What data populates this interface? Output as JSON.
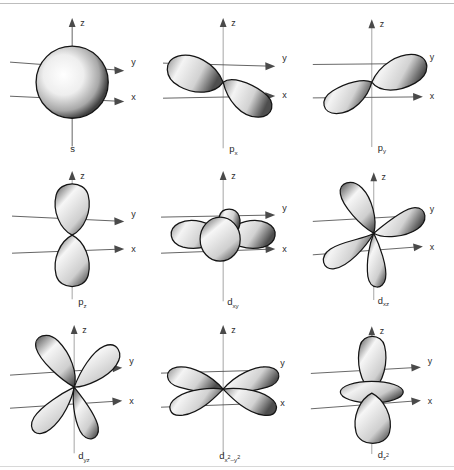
{
  "figure": {
    "type": "diagram-grid",
    "rows": 3,
    "columns": 3,
    "background_color": "#ffffff",
    "line_color": "#4a4a4a",
    "outline_color": "#141414",
    "fill_light": "#ffffff",
    "fill_dark": "#4a4a4a"
  },
  "axes": {
    "z_label": "z",
    "y_label": "y",
    "x_label": "x",
    "description": "Right-handed 3D axes drawn in each panel: z vertical with arrowhead up, y to upper-right with arrowhead, x to lower-right with arrowhead"
  },
  "panels": [
    {
      "id": "s",
      "label_base": "s",
      "label_sub": "",
      "label_sup": "",
      "full_label": "s",
      "shape": "sphere",
      "lobe_count": 1,
      "description": "Single shaded sphere centred on origin"
    },
    {
      "id": "px",
      "label_base": "p",
      "label_sub": "x",
      "label_sup": "",
      "full_label": "px",
      "shape": "two-lobe",
      "lobe_count": 2,
      "description": "Two teardrop lobes along the x axis"
    },
    {
      "id": "py",
      "label_base": "p",
      "label_sub": "y",
      "label_sup": "",
      "full_label": "py",
      "shape": "two-lobe",
      "lobe_count": 2,
      "description": "Two teardrop lobes along the y axis"
    },
    {
      "id": "pz",
      "label_base": "p",
      "label_sub": "z",
      "label_sup": "",
      "full_label": "pz",
      "shape": "two-lobe",
      "lobe_count": 2,
      "description": "Two teardrop lobes along the vertical z axis"
    },
    {
      "id": "dxy",
      "label_base": "d",
      "label_sub": "xy",
      "label_sup": "",
      "full_label": "dxy",
      "shape": "four-lobe-planar",
      "lobe_count": 4,
      "description": "Four lobes in the xy plane between the x and y axes, seen almost edge on"
    },
    {
      "id": "dxz",
      "label_base": "d",
      "label_sub": "xz",
      "label_sup": "",
      "full_label": "dxz",
      "shape": "four-lobe-clover",
      "lobe_count": 4,
      "description": "Four clover lobes between the x and z axes"
    },
    {
      "id": "dyz",
      "label_base": "d",
      "label_sub": "yz",
      "label_sup": "",
      "full_label": "dyz",
      "shape": "four-lobe-clover",
      "lobe_count": 4,
      "description": "Four clover lobes between the y and z axes"
    },
    {
      "id": "dx2y2",
      "label_base": "d",
      "label_sub": "x",
      "label_sup": "2",
      "label_sub2": "–y",
      "label_sup2": "2",
      "full_label": "dx2-y2",
      "shape": "four-lobe-axial",
      "lobe_count": 4,
      "description": "Four lobes lying along the x and y axes, seen nearly edge on"
    },
    {
      "id": "dz2",
      "label_base": "d",
      "label_sub": "z",
      "label_sup": "2",
      "full_label": "dz2",
      "shape": "two-lobe-with-torus",
      "lobe_count": 2,
      "description": "Two lobes along z with a doughnut shaped torus around the middle"
    }
  ]
}
